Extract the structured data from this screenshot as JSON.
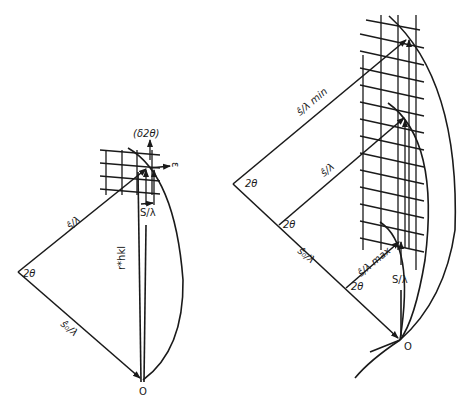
{
  "figure": {
    "left_diagram": {
      "angle_label": "2θ",
      "incident_label": "ŝ₀/λ",
      "diffracted_label": "ŝ/λ",
      "scatter_vector_label": "S/λ",
      "reciprocal_vector_label": "r*hkl",
      "bracket_label": "(δ2θ)",
      "epsilon_label": "ε",
      "origin_label": "O"
    },
    "right_diagram": {
      "angle_labels": [
        "2θ",
        "2θ",
        "2θ"
      ],
      "incident_label": "ŝ₀/λ",
      "diffracted_min_label": "ŝ/λ min",
      "diffracted_label": "ŝ/λ",
      "diffracted_max_label": "ŝ/λ max",
      "scatter_vector_label": "S/λ",
      "origin_label": "O"
    },
    "colors": {
      "ink": "#1a1a1a",
      "background": "#ffffff"
    }
  }
}
